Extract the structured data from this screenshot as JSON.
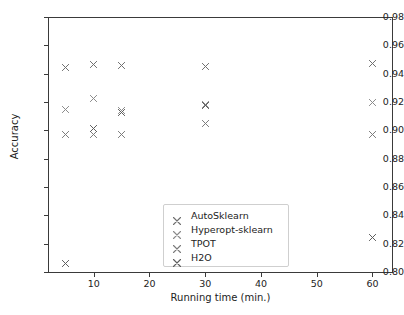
{
  "chart_data": {
    "type": "scatter",
    "title": "",
    "xlabel": "Running time (min.)",
    "ylabel": "Accuracy",
    "xlim": [
      1.8,
      63.5
    ],
    "ylim": [
      0.8,
      0.98
    ],
    "xticks": [
      10,
      20,
      30,
      40,
      50,
      60
    ],
    "xtick_labels": [
      "10",
      "20",
      "30",
      "40",
      "50",
      "60"
    ],
    "yticks": [
      0.8,
      0.82,
      0.84,
      0.86,
      0.88,
      0.9,
      0.92,
      0.94,
      0.96,
      0.98
    ],
    "ytick_labels": [
      "0.80",
      "0.82",
      "0.84",
      "0.86",
      "0.88",
      "0.90",
      "0.92",
      "0.94",
      "0.96",
      "0.98"
    ],
    "grid": false,
    "marker": "x",
    "legend_position": "lower center",
    "series": [
      {
        "name": "AutoSklearn",
        "color": "#6e6e6e",
        "x": [
          5,
          10,
          15,
          30,
          60
        ],
        "y": [
          0.9445,
          0.9465,
          0.946,
          0.945,
          0.947
        ]
      },
      {
        "name": "Hyperopt-sklearn",
        "color": "#8a8a8a",
        "x": [
          5,
          10,
          15,
          30,
          60
        ],
        "y": [
          0.9148,
          0.9222,
          0.914,
          0.9185,
          0.92
        ]
      },
      {
        "name": "TPOT",
        "color": "#7a7a7a",
        "x": [
          5,
          10,
          15,
          30,
          60
        ],
        "y": [
          0.8972,
          0.897,
          0.897,
          0.905,
          0.8968
        ]
      },
      {
        "name": "H2O",
        "color": "#5c5c5c",
        "x": [
          5,
          10,
          15,
          30,
          60
        ],
        "y": [
          0.806,
          0.9012,
          0.9128,
          0.9178,
          0.8243
        ]
      }
    ]
  },
  "legend": {
    "items": [
      {
        "label": "AutoSklearn"
      },
      {
        "label": "Hyperopt-sklearn"
      },
      {
        "label": "TPOT"
      },
      {
        "label": "H2O"
      }
    ]
  }
}
